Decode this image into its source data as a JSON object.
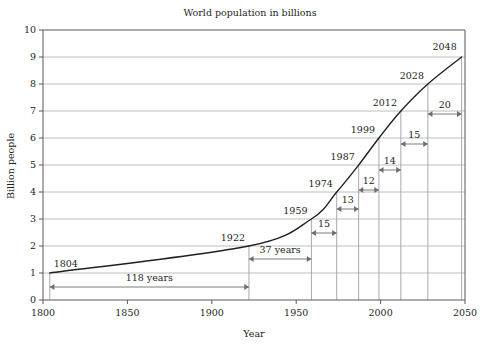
{
  "chart_data": {
    "type": "line",
    "title": "World population in billions",
    "xlabel": "Year",
    "ylabel": "Billion people",
    "xlim": [
      1800,
      2050
    ],
    "ylim": [
      0,
      10
    ],
    "xticks": [
      1800,
      1850,
      1900,
      1950,
      2000,
      2050
    ],
    "xtick_labels": [
      "1800",
      "1850",
      "1900",
      "1950",
      "2000",
      "2050"
    ],
    "yticks": [
      0,
      1,
      2,
      3,
      4,
      5,
      6,
      7,
      8,
      9,
      10
    ],
    "ytick_labels": [
      "0",
      "1",
      "2",
      "3",
      "4",
      "5",
      "6",
      "7",
      "8",
      "9",
      "10"
    ],
    "grid": "horizontal",
    "legend": "none",
    "x": [
      1804,
      1922,
      1959,
      1974,
      1987,
      1999,
      2012,
      2028,
      2048
    ],
    "values": [
      1,
      2,
      3,
      4,
      5,
      6,
      7,
      8,
      9
    ],
    "milestones": [
      {
        "year": 1804,
        "year_label": "1804",
        "billions": 1
      },
      {
        "year": 1922,
        "year_label": "1922",
        "billions": 2
      },
      {
        "year": 1959,
        "year_label": "1959",
        "billions": 3
      },
      {
        "year": 1974,
        "year_label": "1974",
        "billions": 4
      },
      {
        "year": 1987,
        "year_label": "1987",
        "billions": 5
      },
      {
        "year": 1999,
        "year_label": "1999",
        "billions": 6
      },
      {
        "year": 2012,
        "year_label": "2012",
        "billions": 7
      },
      {
        "year": 2028,
        "year_label": "2028",
        "billions": 8
      },
      {
        "year": 2048,
        "year_label": "2048",
        "billions": 9
      }
    ],
    "intervals": [
      {
        "from": 1804,
        "to": 1922,
        "label": "118 years",
        "years": 118
      },
      {
        "from": 1922,
        "to": 1959,
        "label": "37 years",
        "years": 37
      },
      {
        "from": 1959,
        "to": 1974,
        "label": "15",
        "years": 15
      },
      {
        "from": 1974,
        "to": 1987,
        "label": "13",
        "years": 13
      },
      {
        "from": 1987,
        "to": 1999,
        "label": "12",
        "years": 12
      },
      {
        "from": 1999,
        "to": 2012,
        "label": "14",
        "years": 14
      },
      {
        "from": 2012,
        "to": 2028,
        "label": "15",
        "years": 15
      },
      {
        "from": 2028,
        "to": 2048,
        "label": "20",
        "years": 20
      }
    ],
    "colors": {
      "curve": "#231f20",
      "grid": "#bcbec0",
      "axis": "#58595b",
      "drop_line": "#a7a9ac",
      "arrow": "#6d6e71",
      "background": "#ffffff"
    }
  }
}
